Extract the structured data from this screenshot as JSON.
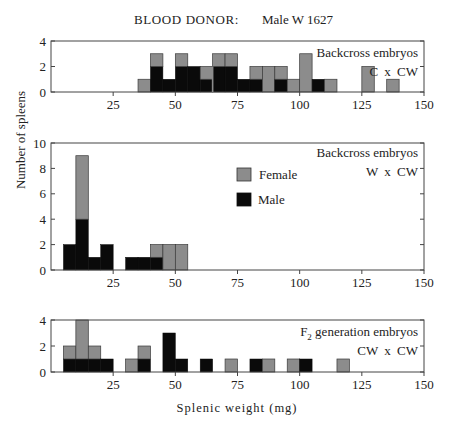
{
  "figure": {
    "title_left": "BLOOD DONOR:",
    "title_right": "Male W 1627",
    "ylabel": "Number of spleens",
    "xlabel": "Splenic weight (mg)",
    "legend": [
      {
        "label": "Female",
        "color": "#8c8c8c"
      },
      {
        "label": "Male",
        "color": "#0a0a0a"
      }
    ],
    "colors": {
      "female": "#8c8c8c",
      "male": "#0a0a0a",
      "axis": "#444444"
    }
  },
  "chart_data": [
    {
      "type": "bar",
      "stacked": true,
      "panel": "top",
      "title": "Backcross embryos",
      "subtitle": "C x CW",
      "xlabel": "",
      "ylabel": "Number of spleens",
      "xlim": [
        0,
        150
      ],
      "ylim": [
        0,
        4
      ],
      "xticks": [
        25,
        50,
        75,
        100,
        125,
        150
      ],
      "yticks": [
        0,
        2,
        4
      ],
      "bin_width": 5,
      "bins": [
        {
          "start": 35,
          "male": 0,
          "female": 1
        },
        {
          "start": 40,
          "male": 2,
          "female": 1
        },
        {
          "start": 45,
          "male": 1,
          "female": 0
        },
        {
          "start": 50,
          "male": 2,
          "female": 1
        },
        {
          "start": 55,
          "male": 2,
          "female": 0
        },
        {
          "start": 60,
          "male": 1,
          "female": 1
        },
        {
          "start": 65,
          "male": 2,
          "female": 1
        },
        {
          "start": 70,
          "male": 2,
          "female": 1
        },
        {
          "start": 75,
          "male": 1,
          "female": 0
        },
        {
          "start": 80,
          "male": 1,
          "female": 1
        },
        {
          "start": 85,
          "male": 0,
          "female": 2
        },
        {
          "start": 90,
          "male": 1,
          "female": 1
        },
        {
          "start": 95,
          "male": 0,
          "female": 1
        },
        {
          "start": 100,
          "male": 0,
          "female": 3
        },
        {
          "start": 105,
          "male": 1,
          "female": 0
        },
        {
          "start": 110,
          "male": 0,
          "female": 1
        },
        {
          "start": 125,
          "male": 0,
          "female": 2
        },
        {
          "start": 135,
          "male": 0,
          "female": 1
        }
      ]
    },
    {
      "type": "bar",
      "stacked": true,
      "panel": "middle",
      "title": "Backcross embryos",
      "subtitle": "W x CW",
      "xlabel": "",
      "ylabel": "Number of spleens",
      "xlim": [
        0,
        150
      ],
      "ylim": [
        0,
        10
      ],
      "xticks": [
        25,
        50,
        75,
        100,
        125,
        150
      ],
      "yticks": [
        0,
        2,
        4,
        6,
        8,
        10
      ],
      "bin_width": 5,
      "legend_position": "center",
      "bins": [
        {
          "start": 5,
          "male": 2,
          "female": 0
        },
        {
          "start": 10,
          "male": 4,
          "female": 5
        },
        {
          "start": 15,
          "male": 1,
          "female": 0
        },
        {
          "start": 20,
          "male": 2,
          "female": 0
        },
        {
          "start": 30,
          "male": 1,
          "female": 0
        },
        {
          "start": 35,
          "male": 1,
          "female": 0
        },
        {
          "start": 40,
          "male": 1,
          "female": 1
        },
        {
          "start": 45,
          "male": 0,
          "female": 2
        },
        {
          "start": 50,
          "male": 0,
          "female": 2
        }
      ]
    },
    {
      "type": "bar",
      "stacked": true,
      "panel": "bottom",
      "title": "F2 generation embryos",
      "subtitle": "CW x CW",
      "xlabel": "Splenic weight (mg)",
      "ylabel": "Number of spleens",
      "xlim": [
        0,
        150
      ],
      "ylim": [
        0,
        4
      ],
      "xticks": [
        25,
        50,
        75,
        100,
        125,
        150
      ],
      "yticks": [
        0,
        2,
        4
      ],
      "bin_width": 5,
      "bins": [
        {
          "start": 5,
          "male": 1,
          "female": 1
        },
        {
          "start": 10,
          "male": 1,
          "female": 3
        },
        {
          "start": 15,
          "male": 1,
          "female": 1
        },
        {
          "start": 20,
          "male": 1,
          "female": 0
        },
        {
          "start": 30,
          "male": 0,
          "female": 1
        },
        {
          "start": 35,
          "male": 1,
          "female": 1
        },
        {
          "start": 45,
          "male": 3,
          "female": 0
        },
        {
          "start": 50,
          "male": 1,
          "female": 0
        },
        {
          "start": 60,
          "male": 1,
          "female": 0
        },
        {
          "start": 70,
          "male": 0,
          "female": 1
        },
        {
          "start": 80,
          "male": 1,
          "female": 0
        },
        {
          "start": 85,
          "male": 0,
          "female": 1
        },
        {
          "start": 95,
          "male": 0,
          "female": 1
        },
        {
          "start": 100,
          "male": 1,
          "female": 0
        },
        {
          "start": 115,
          "male": 0,
          "female": 1
        }
      ]
    }
  ]
}
